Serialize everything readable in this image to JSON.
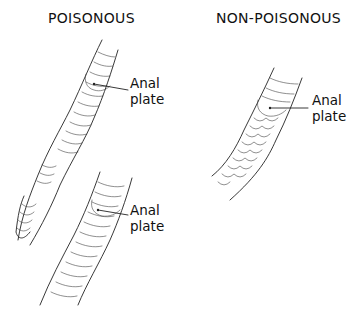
{
  "headings": {
    "poisonous": "POISONOUS",
    "non_poisonous": "NON-POISONOUS"
  },
  "figures": [
    {
      "id": "poisonous-rattlesnake",
      "group": "poisonous",
      "label_line1": "Anal",
      "label_line2": "plate",
      "scale_pattern": "single row of undivided belly plates; tail ends in rattle"
    },
    {
      "id": "poisonous-pitviper",
      "group": "poisonous",
      "label_line1": "Anal",
      "label_line2": "plate",
      "scale_pattern": "single row of undivided plates below anal plate"
    },
    {
      "id": "non-poisonous",
      "group": "non_poisonous",
      "label_line1": "Anal",
      "label_line2": "plate",
      "scale_pattern": "double row of divided scales below anal plate"
    }
  ],
  "colors": {
    "ink": "#222222",
    "background": "#ffffff"
  }
}
